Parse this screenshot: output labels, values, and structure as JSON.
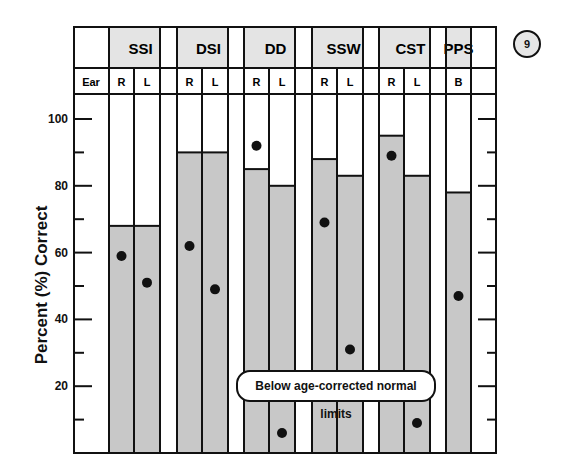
{
  "badge": {
    "label": "9"
  },
  "annotation": {
    "text": "Below age-corrected normal limits"
  },
  "header": {
    "ear_label": "Ear",
    "tests": [
      {
        "name": "SSI",
        "ears": [
          "R",
          "L"
        ]
      },
      {
        "name": "DSI",
        "ears": [
          "R",
          "L"
        ]
      },
      {
        "name": "DD",
        "ears": [
          "R",
          "L"
        ]
      },
      {
        "name": "SSW",
        "ears": [
          "R",
          "L"
        ]
      },
      {
        "name": "CST",
        "ears": [
          "R",
          "L"
        ]
      },
      {
        "name": "PPS",
        "ears": [
          "B"
        ]
      }
    ]
  },
  "colors": {
    "bar_fill": "#c8c8c8",
    "header_fill": "#e4e4e4",
    "line": "#111111",
    "dot": "#111111"
  },
  "chart_data": {
    "type": "bar",
    "title": "",
    "xlabel": "",
    "ylabel": "Percent (%) Correct",
    "ylim": [
      0,
      105
    ],
    "yticks": [
      20,
      40,
      60,
      80,
      100
    ],
    "yticks_minor": [
      10,
      30,
      50,
      70,
      90
    ],
    "grid": false,
    "legend": "none",
    "categories": [
      "SSI R",
      "SSI L",
      "DSI R",
      "DSI L",
      "DD R",
      "DD L",
      "SSW R",
      "SSW L",
      "CST R",
      "CST L",
      "PPS B"
    ],
    "series": [
      {
        "name": "Age-corrected normal limit (bar)",
        "values": [
          68,
          68,
          90,
          90,
          85,
          80,
          88,
          83,
          95,
          83,
          78
        ]
      },
      {
        "name": "Patient score (dot)",
        "values": [
          59,
          51,
          62,
          49,
          92,
          6,
          69,
          31,
          89,
          9,
          47
        ]
      }
    ],
    "annotations": [
      "Below age-corrected normal limits",
      "9"
    ]
  }
}
